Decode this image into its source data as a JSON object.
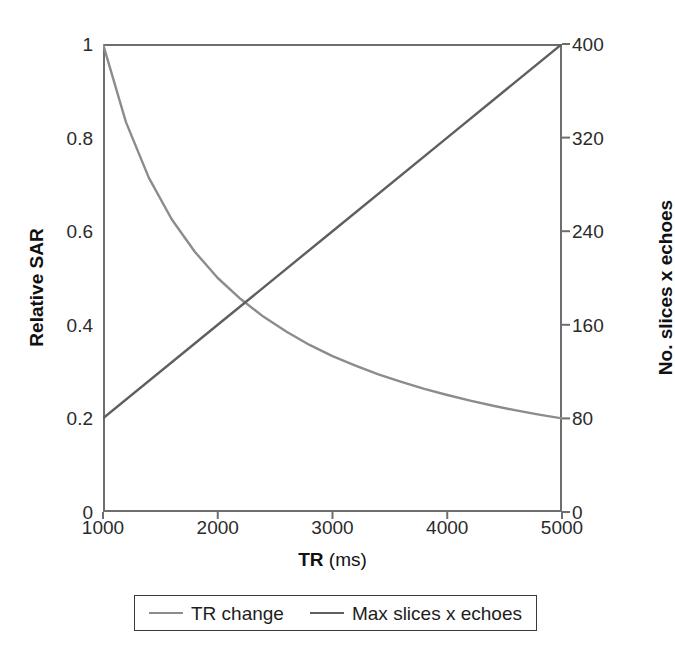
{
  "chart_data": {
    "type": "line",
    "title": "",
    "xlabel_bold": "TR",
    "xlabel_rest": " (ms)",
    "xlabel": "TR (ms)",
    "ylabel": "Relative SAR",
    "ylabel_right": "No. slices x echoes",
    "xlim": [
      1000,
      5000
    ],
    "ylim": [
      0,
      1
    ],
    "ylim_right": [
      0,
      400
    ],
    "xticks": [
      "1000",
      "2000",
      "3000",
      "4000",
      "5000"
    ],
    "xtick_values": [
      1000,
      2000,
      3000,
      4000,
      5000
    ],
    "yticks_left": [
      "0",
      "0.2",
      "0.4",
      "0.6",
      "0.8",
      "1"
    ],
    "ytick_left_values": [
      0,
      0.2,
      0.4,
      0.6,
      0.8,
      1
    ],
    "yticks_right": [
      "0",
      "80",
      "160",
      "240",
      "320",
      "400"
    ],
    "ytick_right_values": [
      0,
      80,
      160,
      240,
      320,
      400
    ],
    "grid": false,
    "legend_position": "below-center",
    "series": [
      {
        "name": "TR change",
        "axis": "left",
        "color": "#8c8c8c",
        "relationship": "1000/TR",
        "x": [
          1000,
          1200,
          1400,
          1600,
          1800,
          2000,
          2200,
          2400,
          2600,
          2800,
          3000,
          3200,
          3400,
          3600,
          3800,
          4000,
          4200,
          4400,
          4600,
          4800,
          5000
        ],
        "values": [
          1.0,
          0.833,
          0.714,
          0.625,
          0.556,
          0.5,
          0.455,
          0.417,
          0.385,
          0.357,
          0.333,
          0.313,
          0.294,
          0.278,
          0.263,
          0.25,
          0.238,
          0.227,
          0.217,
          0.208,
          0.2
        ]
      },
      {
        "name": "Max slices x echoes",
        "axis": "right",
        "color": "#5f5f5f",
        "relationship": "0.08 * TR",
        "x": [
          1000,
          2000,
          3000,
          4000,
          5000
        ],
        "values": [
          80,
          160,
          240,
          320,
          400
        ]
      }
    ],
    "annotations": [
      {
        "text": "curves cross near TR 2240 ms",
        "x": 2240,
        "y_left": 0.446,
        "y_right": 179
      }
    ]
  },
  "legend": {
    "entries": [
      {
        "label": "TR change",
        "color": "#8c8c8c"
      },
      {
        "label": "Max slices x echoes",
        "color": "#5f5f5f"
      }
    ]
  }
}
